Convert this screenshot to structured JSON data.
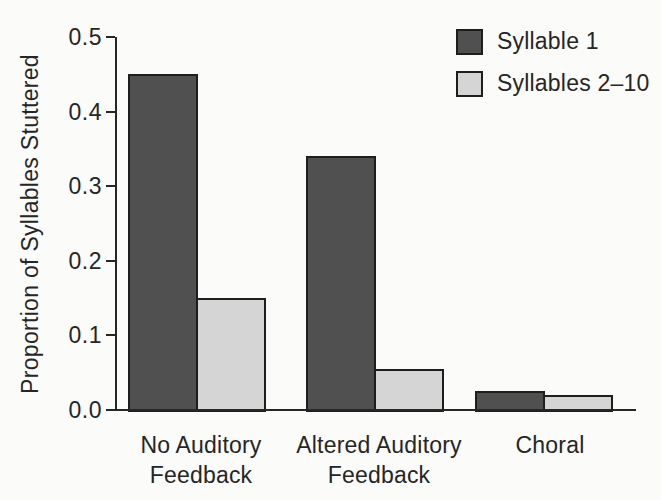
{
  "chart_data": {
    "type": "bar",
    "title": "",
    "xlabel": "",
    "ylabel": "Proportion of Syllables Stuttered",
    "categories": [
      "No Auditory\nFeedback",
      "Altered Auditory\nFeedback",
      "Choral"
    ],
    "series": [
      {
        "name": "Syllable 1",
        "color": "#505050",
        "values": [
          0.45,
          0.34,
          0.025
        ]
      },
      {
        "name": "Syllables 2–10",
        "color": "#d5d5d5",
        "values": [
          0.15,
          0.055,
          0.02
        ]
      }
    ],
    "ylim": [
      0.0,
      0.5
    ],
    "yticks": [
      0.0,
      0.1,
      0.2,
      0.3,
      0.4,
      0.5
    ],
    "ytick_labels": [
      "0.0",
      "0.1",
      "0.2",
      "0.3",
      "0.4",
      "0.5"
    ],
    "grid": false,
    "legend_position": "top-right",
    "bar_edge_color": "#1e1e1e",
    "axis_color": "#262626",
    "text_color": "#262626",
    "background_color": "#fbfbfa"
  }
}
